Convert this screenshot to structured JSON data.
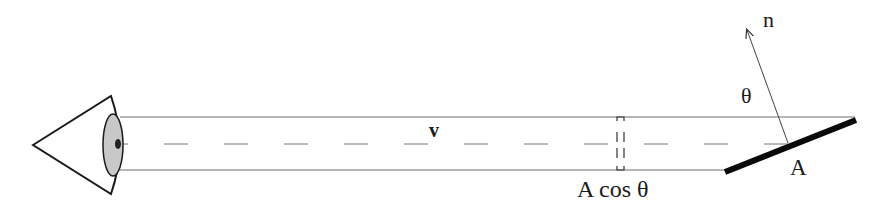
{
  "diagram": {
    "labels": {
      "normal": "n",
      "angle": "θ",
      "view_vector": "v",
      "area": "A",
      "projected_area": "A cos θ"
    },
    "colors": {
      "stroke": "#1a1a1a",
      "thin_line": "#6e6e6e",
      "iris_fill": "#c8c8c8",
      "pupil_fill": "#222222",
      "surface": "#0a0a0a",
      "background": "#ffffff"
    }
  }
}
